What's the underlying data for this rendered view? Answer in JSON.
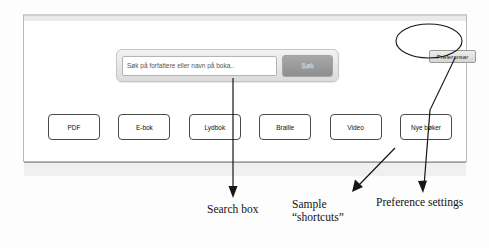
{
  "window": {
    "search": {
      "input_value": "",
      "placeholder": "Søk på forfattere eller navn på boka..",
      "button_label": "Søk"
    },
    "preferences": {
      "button_label": "Preferansar"
    },
    "shortcuts": [
      {
        "label": "PDF"
      },
      {
        "label": "E-bok"
      },
      {
        "label": "Lydbok"
      },
      {
        "label": "Braille"
      },
      {
        "label": "Video"
      },
      {
        "label": "Nye bøker"
      }
    ]
  },
  "annotations": [
    {
      "id": "search-box",
      "text": "Search box"
    },
    {
      "id": "sample-shortcuts",
      "line1": "Sample",
      "line2": "“shortcuts”"
    },
    {
      "id": "preference-settings",
      "text": "Preference settings"
    }
  ],
  "colors": {
    "frame_border": "#b9b9b9",
    "button_border": "#4a4a4a",
    "search_button": "#9b9b9b",
    "annotation_ink": "#131313"
  }
}
